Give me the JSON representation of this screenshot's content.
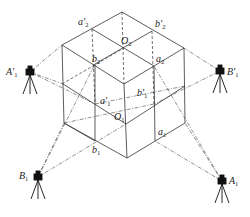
{
  "diagram": {
    "type": "isometric cube with four surveying stations (tripods) sighting cube points",
    "colors": {
      "line": "#333333",
      "background": "#ffffff"
    },
    "points": [
      {
        "id": "a2p",
        "label": "a'",
        "sub": "2",
        "x": 92,
        "y": 29
      },
      {
        "id": "b2p",
        "label": "b'",
        "sub": "2",
        "x": 152,
        "y": 31
      },
      {
        "id": "O2",
        "label": "O",
        "sub": "2",
        "x": 124,
        "y": 48
      },
      {
        "id": "b2",
        "label": "b",
        "sub": "2",
        "x": 95,
        "y": 64
      },
      {
        "id": "a2",
        "label": "a",
        "sub": "2",
        "x": 154,
        "y": 66
      },
      {
        "id": "a1p",
        "label": "a'",
        "sub": "1",
        "x": 95,
        "y": 104
      },
      {
        "id": "b1p",
        "label": "b'",
        "sub": "1",
        "x": 154,
        "y": 104
      },
      {
        "id": "O1",
        "label": "O",
        "sub": "1",
        "x": 126,
        "y": 124
      },
      {
        "id": "b1",
        "label": "b",
        "sub": "1",
        "x": 95,
        "y": 141
      },
      {
        "id": "a1",
        "label": "a",
        "sub": "1",
        "x": 155,
        "y": 141
      }
    ],
    "stations": [
      {
        "id": "A1p",
        "label": "A'",
        "sub": "1",
        "x": 30,
        "y": 72
      },
      {
        "id": "B1p",
        "label": "B'",
        "sub": "1",
        "x": 220,
        "y": 71
      },
      {
        "id": "B1",
        "label": "B",
        "sub": "1",
        "x": 38,
        "y": 177
      },
      {
        "id": "A1",
        "label": "A",
        "sub": "1",
        "x": 222,
        "y": 181
      }
    ]
  },
  "labels": {
    "a2p": "a'",
    "b2p": "b'",
    "O2": "O",
    "b2": "b",
    "a2": "a",
    "a1p": "a'",
    "b1p": "b'",
    "O1": "O",
    "b1": "b",
    "a1": "a",
    "A1p": "A'",
    "B1p": "B'",
    "B1": "B",
    "A1": "A",
    "s1": "1",
    "s2": "2"
  }
}
